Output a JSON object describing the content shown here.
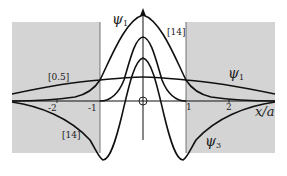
{
  "figure": {
    "type": "wavefunction-diagram",
    "region_shading": {
      "color": "#d4d4d4",
      "regions": [
        {
          "name": "left-barrier",
          "x_from": -3,
          "x_to": -1
        },
        {
          "name": "right-barrier",
          "x_from": 1,
          "x_to": 3
        }
      ]
    },
    "axis": {
      "x_label": "x/a",
      "ticks": [
        {
          "value": -2,
          "label": "-2"
        },
        {
          "value": -1,
          "label": "-1"
        },
        {
          "value": 1,
          "label": "1"
        },
        {
          "value": 2,
          "label": "2"
        }
      ],
      "origin_marker": "circle"
    },
    "curves": [
      {
        "id": "psi1-tall",
        "label": "ψ",
        "subscript": "1",
        "annotation": "[14]",
        "description": "ground state, tall wide peak"
      },
      {
        "id": "psi1-narrow",
        "label": "",
        "subscript": "",
        "annotation": "",
        "description": "narrow central peak"
      },
      {
        "id": "psi1-flat",
        "label": "ψ",
        "subscript": "1",
        "annotation": "[0.5]",
        "description": "flat broad curve"
      },
      {
        "id": "psi3",
        "label": "ψ",
        "subscript": "3",
        "annotation": "[14]",
        "description": "third state with negative lobes"
      }
    ],
    "labels": {
      "psi1_top": {
        "sym": "ψ",
        "sub": "1"
      },
      "psi1_right": {
        "sym": "ψ",
        "sub": "1"
      },
      "psi3": {
        "sym": "ψ",
        "sub": "3"
      },
      "bracket_top_right": "[14]",
      "bracket_left": "[0.5]",
      "bracket_bottom_left": "[14]",
      "x_axis": "x/a",
      "tick_m2": "-2",
      "tick_m1": "-1",
      "tick_1": "1",
      "tick_2": "2"
    }
  }
}
